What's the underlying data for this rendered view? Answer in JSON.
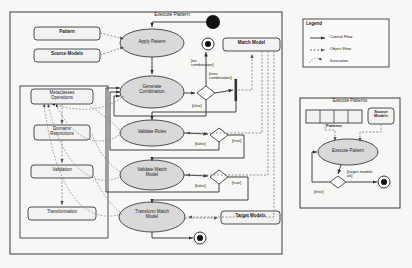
{
  "diagram": {
    "type": "uml-activity-diagram",
    "background_color": "#f7f7f5",
    "node_fill": "#d9d9d9",
    "box_fill": "#f2f2f2",
    "stroke_color": "#3a3a3a",
    "main_frame_title": "Execute Pattern"
  },
  "legend": {
    "title": "Legend",
    "items": [
      {
        "label": "Control Flow",
        "style": "solid-arrow"
      },
      {
        "label": "Object Flow",
        "style": "dashed-arrow"
      },
      {
        "label": "Invocation",
        "style": "curved-dashed-arrow"
      }
    ]
  },
  "main": {
    "title": "Execute Pattern",
    "object_nodes": [
      {
        "id": "pattern",
        "label": "Pattern"
      },
      {
        "id": "source_models",
        "label": "Source Models"
      },
      {
        "id": "match_model",
        "label": "Match Model"
      },
      {
        "id": "target_models",
        "label": "Target Models"
      }
    ],
    "activities": [
      {
        "id": "apply_pattern",
        "label": "Apply Pattern"
      },
      {
        "id": "generate_combination",
        "label": "Generate Combination",
        "line1": "Generate",
        "line2": "Combination"
      },
      {
        "id": "validate_roles",
        "label": "Validate Roles"
      },
      {
        "id": "validate_match_model",
        "label": "Validate Match Model",
        "line1": "Validate Match",
        "line2": "Model"
      },
      {
        "id": "transform_match_model",
        "label": "Transform Match Model",
        "line1": "Transform Match",
        "line2": "Model"
      }
    ],
    "operations_panel": {
      "items": [
        {
          "id": "metaclasses_operations",
          "line1": "Metaclasses",
          "line2": "Operations"
        },
        {
          "id": "domains_restrictions",
          "line1": "Domains",
          "line2": "Restrictions"
        },
        {
          "id": "validation",
          "line1": "Validation",
          "line2": ""
        },
        {
          "id": "transformation",
          "line1": "Transformation",
          "line2": ""
        }
      ]
    },
    "guards": [
      {
        "id": "no_combination",
        "line1": "[no",
        "line2": "combination]"
      },
      {
        "id": "new_combination",
        "line1": "[new",
        "line2": "combination]"
      },
      {
        "id": "else_gen",
        "line1": "[else]",
        "line2": ""
      },
      {
        "id": "false_roles",
        "line1": "[false]",
        "line2": ""
      },
      {
        "id": "true_roles",
        "line1": "[true]",
        "line2": ""
      },
      {
        "id": "false_match",
        "line1": "[false]",
        "line2": ""
      },
      {
        "id": "true_match",
        "line1": "[true]",
        "line2": ""
      }
    ]
  },
  "sub": {
    "title": "Execute Patterns",
    "patterns_label": "Patterns",
    "patterns_cells": 4,
    "source_models_label": "Source Models",
    "source_models_line1": "Source",
    "source_models_line2": "Models",
    "activity_label": "Execute Pattern",
    "guards": [
      {
        "id": "target_ok",
        "line1": "[target models",
        "line2": "ok]"
      },
      {
        "id": "else_sub",
        "line1": "[else]",
        "line2": ""
      }
    ]
  }
}
